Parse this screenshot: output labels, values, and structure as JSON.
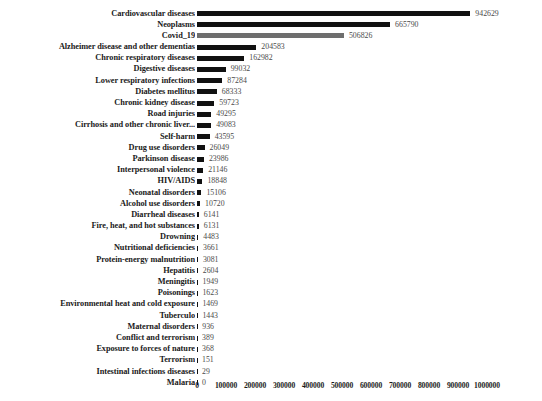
{
  "chart_data": {
    "type": "bar",
    "orientation": "horizontal",
    "title": "",
    "xlabel": "",
    "ylabel": "",
    "xlim": [
      0,
      1000000
    ],
    "xticks": [
      0,
      100000,
      200000,
      300000,
      400000,
      500000,
      600000,
      700000,
      800000,
      900000,
      1000000
    ],
    "xtick_labels": [
      "0",
      "100000",
      "200000",
      "300000",
      "400000",
      "500000",
      "600000",
      "700000",
      "800000",
      "900000",
      "1000000"
    ],
    "grid": false,
    "legend": "none",
    "data_labels": true,
    "bar_color": "#111111",
    "highlight_color": "#6e6e6e",
    "highlight_category": "Covid_19",
    "categories": [
      "Cardiovascular diseases",
      "Neoplasms",
      "Covid_19",
      "Alzheimer disease and other dementias",
      "Chronic respiratory diseases",
      "Digestive diseases",
      "Lower respiratory infections",
      "Diabetes mellitus",
      "Chronic kidney disease",
      "Road injuries",
      "Cirrhosis and other chronic liver...",
      "Self-harm",
      "Drug use disorders",
      "Parkinson disease",
      "Interpersonal violence",
      "HIV/AIDS",
      "Neonatal disorders",
      "Alcohol use disorders",
      "Diarrheal diseases",
      "Fire, heat, and hot substances",
      "Drowning",
      "Nutritional deficiencies",
      "Protein-energy malnutrition",
      "Hepatitis",
      "Meningitis",
      "Poisonings",
      "Environmental heat and cold exposure",
      "Tuberculo",
      "Maternal disorders",
      "Conflict and terrorism",
      "Exposure to forces of nature",
      "Terrorism",
      "Intestinal infections diseases",
      "Malaria"
    ],
    "values": [
      942629,
      665790,
      506826,
      204583,
      162982,
      99032,
      87284,
      68333,
      59723,
      49295,
      49083,
      43595,
      26049,
      23986,
      21146,
      18848,
      15106,
      10720,
      6141,
      6131,
      4483,
      3661,
      3081,
      2604,
      1949,
      1623,
      1469,
      1443,
      936,
      389,
      368,
      151,
      29,
      0
    ],
    "value_labels": [
      "942629",
      "665790",
      "506826",
      "204583",
      "162982",
      "99032",
      "87284",
      "68333",
      "59723",
      "49295",
      "49083",
      "43595",
      "26049",
      "23986",
      "21146",
      "18848",
      "15106",
      "10720",
      "6141",
      "6131",
      "4483",
      "3661",
      "3081",
      "2604",
      "1949",
      "1623",
      "1469",
      "1443",
      "936",
      "389",
      "368",
      "151",
      "29",
      "0"
    ]
  }
}
